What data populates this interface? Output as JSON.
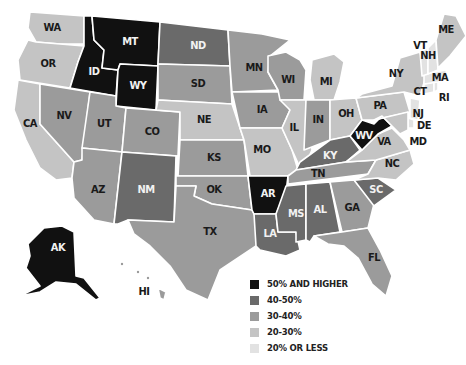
{
  "chart_data": {
    "type": "choropleth",
    "title": "",
    "legend": [
      {
        "key": "c50",
        "label": "50% AND HIGHER",
        "color": "#111111"
      },
      {
        "key": "c40",
        "label": "40-50%",
        "color": "#6a6a6a"
      },
      {
        "key": "c30",
        "label": "30-40%",
        "color": "#9b9b9b"
      },
      {
        "key": "c20",
        "label": "20-30%",
        "color": "#c4c4c4"
      },
      {
        "key": "c00",
        "label": "20% OR LESS",
        "color": "#e2e2e2"
      }
    ],
    "states": {
      "WA": "c20",
      "OR": "c20",
      "CA": "c20",
      "ID": "c50",
      "MT": "c50",
      "WY": "c50",
      "NV": "c30",
      "UT": "c30",
      "CO": "c30",
      "AZ": "c30",
      "NM": "c40",
      "ND": "c40",
      "SD": "c30",
      "NE": "c20",
      "KS": "c30",
      "OK": "c30",
      "TX": "c30",
      "MN": "c30",
      "IA": "c30",
      "MO": "c20",
      "AR": "c50",
      "LA": "c40",
      "WI": "c30",
      "IL": "c20",
      "MI": "c20",
      "IN": "c30",
      "OH": "c20",
      "KY": "c40",
      "TN": "c30",
      "MS": "c40",
      "AL": "c40",
      "GA": "c30",
      "FL": "c30",
      "SC": "c40",
      "NC": "c20",
      "VA": "c20",
      "WV": "c50",
      "PA": "c20",
      "NY": "c20",
      "NJ": "c00",
      "DE": "c00",
      "MD": "c20",
      "CT": "c00",
      "RI": "c00",
      "MA": "c00",
      "VT": "c00",
      "NH": "c00",
      "ME": "c20",
      "AK": "c50",
      "HI": "c30"
    }
  },
  "legend": {
    "items": [
      {
        "label": "50% AND HIGHER",
        "color": "#111111"
      },
      {
        "label": "40-50%",
        "color": "#6a6a6a"
      },
      {
        "label": "30-40%",
        "color": "#9b9b9b"
      },
      {
        "label": "20-30%",
        "color": "#c4c4c4"
      },
      {
        "label": "20% OR LESS",
        "color": "#e2e2e2"
      }
    ]
  },
  "labels": {
    "WA": "WA",
    "OR": "OR",
    "CA": "CA",
    "ID": "ID",
    "MT": "MT",
    "WY": "WY",
    "NV": "NV",
    "UT": "UT",
    "CO": "CO",
    "AZ": "AZ",
    "NM": "NM",
    "ND": "ND",
    "SD": "SD",
    "NE": "NE",
    "KS": "KS",
    "OK": "OK",
    "TX": "TX",
    "MN": "MN",
    "IA": "IA",
    "MO": "MO",
    "AR": "AR",
    "LA": "LA",
    "WI": "WI",
    "IL": "IL",
    "MI": "MI",
    "IN": "IN",
    "OH": "OH",
    "KY": "KY",
    "TN": "TN",
    "MS": "MS",
    "AL": "AL",
    "GA": "GA",
    "FL": "FL",
    "SC": "SC",
    "NC": "NC",
    "VA": "VA",
    "WV": "WV",
    "PA": "PA",
    "NY": "NY",
    "NJ": "NJ",
    "DE": "DE",
    "MD": "MD",
    "CT": "CT",
    "RI": "RI",
    "MA": "MA",
    "VT": "VT",
    "NH": "NH",
    "ME": "ME",
    "AK": "AK",
    "HI": "HI"
  }
}
